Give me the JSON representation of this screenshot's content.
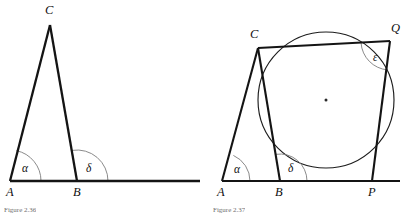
{
  "document": {
    "kind": "geometry-figure-pair",
    "background": "#ffffff",
    "ink": "#141414",
    "arc_color": "#7d7d7d",
    "width": 413,
    "height": 215
  },
  "figure_left": {
    "caption": "Figure 2.36",
    "vertices": [
      {
        "label": "A",
        "x": 10,
        "y": 181,
        "label_x": 6,
        "label_y": 196
      },
      {
        "label": "B",
        "x": 77,
        "y": 181,
        "label_x": 73,
        "label_y": 196
      },
      {
        "label": "C",
        "x": 50,
        "y": 25,
        "label_x": 45,
        "label_y": 14
      }
    ],
    "segments": [
      {
        "name": "side-AC",
        "from": "A",
        "to": "C",
        "width": 2.3
      },
      {
        "name": "side-BC",
        "from": "B",
        "to": "C",
        "width": 2.3
      },
      {
        "name": "base-ray-AB-extended",
        "x1": 10,
        "y1": 181,
        "x2": 200,
        "y2": 181,
        "width": 2.3
      }
    ],
    "angles": [
      {
        "symbol": "α",
        "name": "alpha",
        "at": "A",
        "vertex_x": 10,
        "vertex_y": 181,
        "radius": 31,
        "start_deg": 0,
        "end_deg": 78,
        "label_x": 22,
        "label_y": 172
      },
      {
        "symbol": "δ",
        "name": "delta",
        "at": "B",
        "vertex_x": 77,
        "vertex_y": 181,
        "radius": 31,
        "start_deg": 0,
        "end_deg": 99,
        "label_x": 86,
        "label_y": 172
      }
    ]
  },
  "figure_right": {
    "caption": "Figure 2.37",
    "vertices": [
      {
        "label": "A",
        "x": 222,
        "y": 181,
        "label_x": 217,
        "label_y": 196
      },
      {
        "label": "B",
        "x": 280,
        "y": 181,
        "label_x": 275,
        "label_y": 196
      },
      {
        "label": "C",
        "x": 258,
        "y": 48,
        "label_x": 250,
        "label_y": 38
      },
      {
        "label": "P",
        "x": 372,
        "y": 181,
        "label_x": 368,
        "label_y": 196
      },
      {
        "label": "Q",
        "x": 390,
        "y": 41,
        "label_x": 391,
        "label_y": 32
      }
    ],
    "circle": {
      "name": "circumcircle",
      "cx": 326,
      "cy": 100,
      "r": 68
    },
    "center_dot": {
      "cx": 326,
      "cy": 100,
      "r": 1.5
    },
    "segments": [
      {
        "name": "side-AC",
        "from": "A",
        "to": "C",
        "width": 2.1
      },
      {
        "name": "side-BC",
        "from": "B",
        "to": "C",
        "width": 2.1
      },
      {
        "name": "chord-CQ",
        "from": "C",
        "to": "Q",
        "width": 2.1
      },
      {
        "name": "chord-QP",
        "from": "Q",
        "to": "P",
        "width": 2.1
      },
      {
        "name": "base-ray-AP-extended",
        "x1": 222,
        "y1": 181,
        "x2": 400,
        "y2": 181,
        "width": 2.1
      }
    ],
    "angles": [
      {
        "symbol": "α",
        "name": "alpha",
        "at": "A",
        "vertex_x": 222,
        "vertex_y": 181,
        "radius": 28,
        "start_deg": 0,
        "end_deg": 66,
        "label_x": 234,
        "label_y": 173
      },
      {
        "symbol": "δ",
        "name": "delta",
        "at": "B",
        "vertex_x": 280,
        "vertex_y": 181,
        "radius": 27,
        "start_deg": 0,
        "end_deg": 99,
        "label_x": 288,
        "label_y": 172
      },
      {
        "symbol": "ε",
        "name": "epsilon",
        "at": "Q",
        "vertex_x": 390,
        "vertex_y": 41,
        "radius": 29,
        "start_deg": 184,
        "end_deg": 265,
        "label_x": 373,
        "label_y": 61
      }
    ]
  }
}
